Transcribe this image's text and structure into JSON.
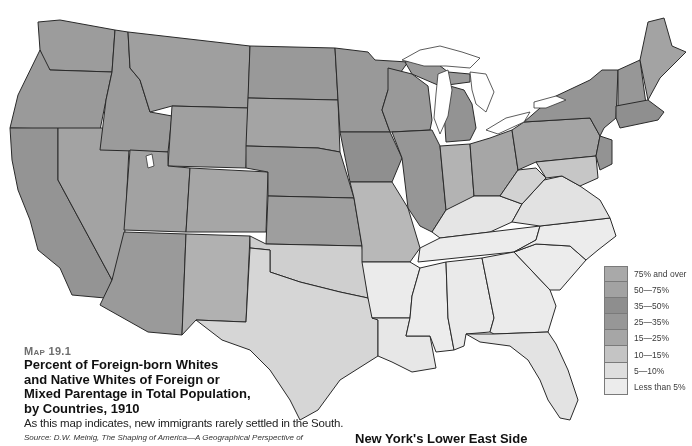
{
  "map": {
    "number_label": "Map 19.1",
    "title": "Percent of Foreign-born Whites and Native Whites of Foreign or Mixed Parentage in Total Population, by Countries, 1910",
    "title_lines": [
      "Percent of Foreign-born Whites",
      "and Native Whites of Foreign or",
      "Mixed Parentage in Total Population,",
      "by Countries, 1910"
    ],
    "description": "As this map indicates, new immigrants rarely settled in the South.",
    "source_prefix": "Source:",
    "source_text": "D.W. Meinig, The Shaping of America—A Geographical Perspective of",
    "region": "United States (contiguous), county-level shading"
  },
  "legend": {
    "items": [
      {
        "label": "75% and over",
        "color": "#a9a9a9"
      },
      {
        "label": "50—75%",
        "color": "#a2a2a2"
      },
      {
        "label": "35—50%",
        "color": "#8e8e8e"
      },
      {
        "label": "25—35%",
        "color": "#979797"
      },
      {
        "label": "15—25%",
        "color": "#a6a6a6"
      },
      {
        "label": "10—15%",
        "color": "#c4c4c4"
      },
      {
        "label": "5—10%",
        "color": "#dedede"
      },
      {
        "label": "Less than 5%",
        "color": "#ececec"
      }
    ]
  },
  "bottom_heading": "New York's Lower East Side",
  "colors": {
    "north_dark": "#8f8f8f",
    "north_mid": "#9c9c9c",
    "west_mid": "#a3a3a3",
    "plains_light": "#b5b5b5",
    "texas_light": "#d3d3d3",
    "south_light": "#e9e9e9",
    "very_light": "#f1f1f1",
    "border": "#2a2a2a"
  }
}
